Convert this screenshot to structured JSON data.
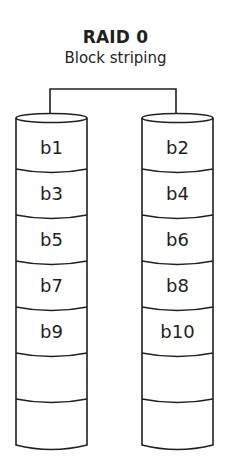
{
  "title": "RAID 0",
  "subtitle": "Block striping",
  "colors": {
    "stroke": "#231f20",
    "background": "#ffffff"
  },
  "disks": [
    {
      "name": "disk-1",
      "blocks": [
        "b1",
        "b3",
        "b5",
        "b7",
        "b9",
        "",
        ""
      ]
    },
    {
      "name": "disk-2",
      "blocks": [
        "b2",
        "b4",
        "b6",
        "b8",
        "b10",
        "",
        ""
      ]
    }
  ]
}
